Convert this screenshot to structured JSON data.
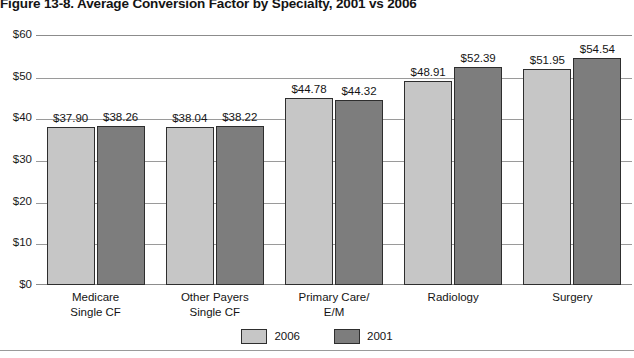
{
  "figure": {
    "title": "Figure 13-8. Average Conversion Factor by Specialty, 2001 vs 2006"
  },
  "chart_data": {
    "type": "bar",
    "title": "Figure 13-8. Average Conversion Factor by Specialty, 2001 vs 2006",
    "xlabel": "",
    "ylabel": "",
    "ylim": [
      0,
      60
    ],
    "ytick_labels": [
      "$60",
      "$50",
      "$40",
      "$30",
      "$20",
      "$10",
      "$0"
    ],
    "ytick_values": [
      60,
      50,
      40,
      30,
      20,
      10,
      0
    ],
    "grid": true,
    "legend_position": "bottom",
    "categories": [
      "Medicare\nSingle CF",
      "Other Payers\nSingle CF",
      "Primary Care/\nE/M",
      "Radiology",
      "Surgery"
    ],
    "category_lines": [
      [
        "Medicare",
        "Single CF"
      ],
      [
        "Other Payers",
        "Single CF"
      ],
      [
        "Primary Care/",
        "E/M"
      ],
      [
        "Radiology",
        ""
      ],
      [
        "Surgery",
        ""
      ]
    ],
    "series": [
      {
        "name": "2006",
        "color": "#c6c6c6",
        "values": [
          37.9,
          38.04,
          44.78,
          48.91,
          51.95
        ],
        "labels": [
          "$37.90",
          "$38.04",
          "$44.78",
          "$48.91",
          "$51.95"
        ]
      },
      {
        "name": "2001",
        "color": "#7d7d7d",
        "values": [
          38.26,
          38.22,
          44.32,
          52.39,
          54.54
        ],
        "labels": [
          "$38.26",
          "$38.22",
          "$44.32",
          "$52.39",
          "$54.54"
        ]
      }
    ]
  },
  "legend": {
    "items": [
      {
        "label": "2006",
        "color": "#c6c6c6"
      },
      {
        "label": "2001",
        "color": "#7d7d7d"
      }
    ]
  }
}
